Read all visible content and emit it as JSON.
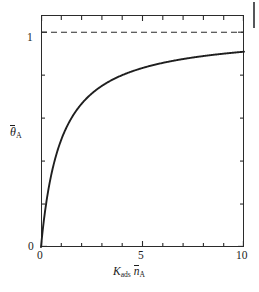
{
  "figure": {
    "background": "#ffffff",
    "ink_color": "#2b2b2b",
    "page_rule_color": "#55565a"
  },
  "axis_titles": {
    "y_theta": "θ",
    "y_sub": "A",
    "x_k": "K",
    "x_k_sub": "ads",
    "x_n": "n",
    "x_n_sub": "A"
  },
  "ticks": {
    "y_labels": [
      "1",
      "0"
    ],
    "x_labels": [
      "0",
      "5",
      "10"
    ]
  },
  "chart_data": {
    "type": "line",
    "title": "",
    "xlabel": "K_ads n̄_A",
    "ylabel": "θ̄_A",
    "xlim": [
      0,
      10
    ],
    "ylim": [
      0,
      1.08
    ],
    "grid": false,
    "legend": null,
    "x_major_ticks": [
      0,
      5,
      10
    ],
    "x_minor_ticks": [
      1,
      2,
      3,
      4,
      6,
      7,
      8,
      9
    ],
    "y_major_ticks": [
      0,
      1
    ],
    "y_minor_ticks": [
      0.2,
      0.4,
      0.6,
      0.8
    ],
    "series": [
      {
        "name": "Langmuir isotherm",
        "style": "solid",
        "color": "#1f1f1f",
        "equation": "theta = x / (1 + x)",
        "x": [
          0,
          0.1,
          0.2,
          0.3,
          0.4,
          0.5,
          0.7,
          1.0,
          1.3,
          1.6,
          2.0,
          2.5,
          3.0,
          3.5,
          4.0,
          5.0,
          6.0,
          7.0,
          8.0,
          9.0,
          10.0
        ],
        "values": [
          0.0,
          0.091,
          0.167,
          0.231,
          0.286,
          0.333,
          0.412,
          0.5,
          0.565,
          0.615,
          0.667,
          0.714,
          0.75,
          0.778,
          0.8,
          0.833,
          0.857,
          0.875,
          0.889,
          0.9,
          0.909
        ]
      },
      {
        "name": "Saturation asymptote",
        "style": "dashed",
        "color": "#2b2b2b",
        "constant_y": 1.0,
        "x": [
          0,
          10
        ],
        "values": [
          1.0,
          1.0
        ]
      }
    ]
  }
}
